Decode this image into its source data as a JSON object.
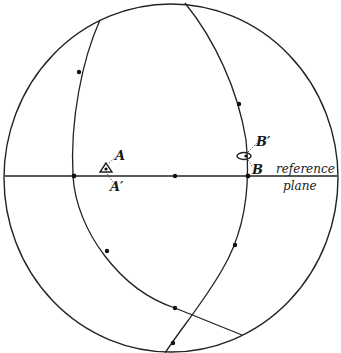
{
  "diagram": {
    "type": "stereographic projection",
    "colors": {
      "stroke": "#222222",
      "background": "#ffffff"
    },
    "labels": {
      "A": "A",
      "A_prime": "A′",
      "B": "B",
      "B_prime": "B′",
      "reference_line1": "reference",
      "reference_line2": "plane"
    },
    "symbols": {
      "A": "triangle",
      "B": "ellipse"
    },
    "poles": [
      {
        "name": "left-arc-pole-1"
      },
      {
        "name": "left-arc-pole-2"
      },
      {
        "name": "left-arc-pole-3"
      },
      {
        "name": "left-arc-pole-4"
      },
      {
        "name": "center-pole"
      },
      {
        "name": "right-arc-pole-1"
      },
      {
        "name": "right-arc-pole-2"
      },
      {
        "name": "right-arc-pole-3"
      },
      {
        "name": "right-arc-pole-4"
      }
    ]
  }
}
